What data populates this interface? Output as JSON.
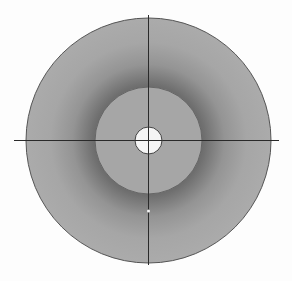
{
  "diagram": {
    "type": "concentric-circle-target",
    "background": "#fdfdfd",
    "center": {
      "x": 148.5,
      "y": 140.5
    },
    "outer_circle": {
      "radius": 122.5,
      "fill_edge": "#a9a9a9",
      "fill_mid": "#8a8a8a",
      "stroke": "#555555"
    },
    "inner_circle": {
      "radius": 53.5,
      "fill": "#a6a6a6",
      "stroke": "#666666"
    },
    "center_hole": {
      "radius": 13.5,
      "fill": "#f5f5f5",
      "stroke": "#444444"
    },
    "crosshair": {
      "horizontal": {
        "x1": 14,
        "x2": 279,
        "y": 140.5
      },
      "vertical": {
        "y1": 15,
        "y2": 265,
        "x": 148.5
      },
      "color": "#2a2a2a"
    },
    "marker_dot": {
      "x": 148.5,
      "y": 211,
      "radius": 1.5,
      "fill": "#f2f2f2"
    }
  }
}
